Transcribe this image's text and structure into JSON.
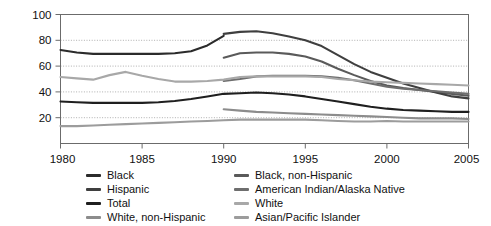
{
  "chart_data": {
    "type": "line",
    "title": "",
    "xlabel": "",
    "ylabel": "",
    "xlim": [
      1980,
      2005
    ],
    "ylim": [
      0,
      100
    ],
    "yticks": [
      20,
      40,
      60,
      80,
      100
    ],
    "xticks": [
      1980,
      1985,
      1990,
      1995,
      2000,
      2005
    ],
    "grid": "horizontal-dotted",
    "legend_position": "bottom",
    "legend_columns": 2,
    "x": [
      1980,
      1981,
      1982,
      1983,
      1984,
      1985,
      1986,
      1987,
      1988,
      1989,
      1990,
      1991,
      1992,
      1993,
      1994,
      1995,
      1996,
      1997,
      1998,
      1999,
      2000,
      2001,
      2002,
      2003,
      2004,
      2005
    ],
    "series": [
      {
        "name": "Black",
        "color": "#2b2b2b",
        "x": [
          1980,
          1981,
          1982,
          1983,
          1984,
          1985,
          1986,
          1987,
          1988,
          1989,
          1990
        ],
        "values": [
          72.5,
          70.5,
          69.5,
          69.5,
          69.5,
          69.5,
          69.5,
          70,
          71.5,
          76,
          83.5
        ]
      },
      {
        "name": "Black, non-Hispanic",
        "color": "#5a5a5a",
        "x": [
          1990,
          1991,
          1992,
          1993,
          1994,
          1995,
          1996,
          1997,
          1998,
          1999,
          2000,
          2001,
          2002,
          2003,
          2004,
          2005
        ],
        "values": [
          66.5,
          70,
          70.5,
          70.5,
          69.5,
          67.5,
          63.5,
          58,
          53,
          48.5,
          45,
          43,
          41.5,
          40,
          38.5,
          37
        ]
      },
      {
        "name": "Hispanic",
        "color": "#3f3f3f",
        "x": [
          1990,
          1991,
          1992,
          1993,
          1994,
          1995,
          1996,
          1997,
          1998,
          1999,
          2000,
          2001,
          2002,
          2003,
          2004,
          2005
        ],
        "values": [
          85,
          86.5,
          87,
          85.5,
          83,
          80,
          75.5,
          68.5,
          61.5,
          55.5,
          51,
          46.5,
          43,
          39.5,
          36.5,
          35
        ]
      },
      {
        "name": "Total",
        "color": "#1f1f1f",
        "x": [
          1980,
          1981,
          1982,
          1983,
          1984,
          1985,
          1986,
          1987,
          1988,
          1989,
          1990,
          1991,
          1992,
          1993,
          1994,
          1995,
          1996,
          1997,
          1998,
          1999,
          2000,
          2001,
          2002,
          2003,
          2004,
          2005
        ],
        "values": [
          32.5,
          32,
          31.5,
          31.5,
          31.5,
          31.5,
          32,
          33,
          34.5,
          36.5,
          38.5,
          39,
          39.5,
          39,
          38,
          36.5,
          34.5,
          32.5,
          30.5,
          28.5,
          27,
          26,
          25.5,
          25,
          24.5,
          24.5
        ]
      },
      {
        "name": "American Indian/Alaska Native",
        "color": "#6e6e6e",
        "x": [
          1990,
          1991,
          1992,
          1993,
          1994,
          1995,
          1996,
          1997,
          1998,
          1999,
          2000,
          2001,
          2002,
          2003,
          2004,
          2005
        ],
        "values": [
          48.5,
          50,
          52,
          52.5,
          52.5,
          52.5,
          52,
          51,
          49,
          46.5,
          44,
          42.5,
          41.5,
          40.5,
          39.5,
          38.5
        ]
      },
      {
        "name": "White, non-Hispanic",
        "color": "#8c8c8c",
        "x": [
          1990,
          1991,
          1992,
          1993,
          1994,
          1995,
          1996,
          1997,
          1998,
          1999,
          2000,
          2001,
          2002,
          2003,
          2004,
          2005
        ],
        "values": [
          26.5,
          25.5,
          24.5,
          24,
          23.5,
          23,
          22.5,
          22,
          21.5,
          21,
          20.5,
          20,
          19.5,
          19.5,
          19.5,
          19
        ]
      },
      {
        "name": "White",
        "color": "#a8a8a8",
        "x": [
          1980,
          1981,
          1982,
          1983,
          1984,
          1985,
          1986,
          1987,
          1988,
          1989,
          1990,
          1991,
          1992,
          1993,
          1994,
          1995,
          1996,
          1997,
          1998,
          1999,
          2000,
          2001,
          2002,
          2003,
          2004,
          2005
        ],
        "values": [
          51.5,
          50.5,
          49.5,
          53,
          55.5,
          52.5,
          50,
          48,
          48,
          48.5,
          49.5,
          51.5,
          52,
          52,
          52,
          52,
          51.5,
          50,
          49,
          48,
          47.5,
          47,
          46.5,
          46,
          45.5,
          45
        ]
      },
      {
        "name": "Asian/Pacific Islander",
        "color": "#9c9c9c",
        "x": [
          1980,
          1981,
          1982,
          1983,
          1984,
          1985,
          1986,
          1987,
          1988,
          1989,
          1990,
          1991,
          1992,
          1993,
          1994,
          1995,
          1996,
          1997,
          1998,
          1999,
          2000,
          2001,
          2002,
          2003,
          2004,
          2005
        ],
        "values": [
          13.5,
          13.5,
          14,
          14.5,
          15,
          15.5,
          16,
          16.5,
          17,
          17.5,
          18,
          18.5,
          18.5,
          18.5,
          18.5,
          18.5,
          18,
          17.5,
          17,
          17,
          17.5,
          17,
          17,
          17,
          17,
          17
        ]
      }
    ]
  },
  "axis": {
    "ytick_labels": [
      "100",
      "80",
      "60",
      "40",
      "20"
    ],
    "xtick_labels": [
      "1980",
      "1985",
      "1990",
      "1995",
      "2000",
      "2005"
    ]
  },
  "legend": {
    "column_left": [
      {
        "label": "Black",
        "color": "#2b2b2b"
      },
      {
        "label": "Hispanic",
        "color": "#3f3f3f"
      },
      {
        "label": "Total",
        "color": "#1f1f1f"
      },
      {
        "label": "White, non-Hispanic",
        "color": "#8c8c8c"
      }
    ],
    "column_right": [
      {
        "label": "Black, non-Hispanic",
        "color": "#5a5a5a"
      },
      {
        "label": "American Indian/Alaska Native",
        "color": "#6e6e6e"
      },
      {
        "label": "White",
        "color": "#a8a8a8"
      },
      {
        "label": "Asian/Pacific Islander",
        "color": "#9c9c9c"
      }
    ]
  }
}
